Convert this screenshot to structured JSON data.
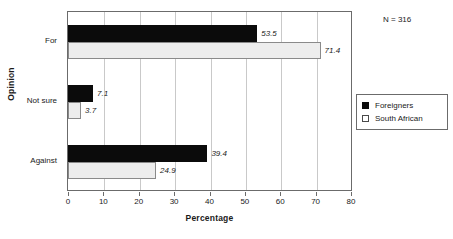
{
  "chart_data": {
    "type": "bar",
    "orientation": "horizontal",
    "title": "",
    "xlabel": "Percentage",
    "ylabel": "Opinion",
    "categories": [
      "For",
      "Not sure",
      "Against"
    ],
    "series": [
      {
        "name": "Foreigners",
        "values": [
          53.5,
          7.1,
          39.4
        ],
        "color": "#0b0b0b"
      },
      {
        "name": "South African",
        "values": [
          71.4,
          3.7,
          24.9
        ],
        "color": "#ededed"
      }
    ],
    "xlim": [
      0,
      80
    ],
    "xticks": [
      0,
      10,
      20,
      30,
      40,
      50,
      60,
      70,
      80
    ],
    "xtick_labels": [
      "0",
      "10",
      "20",
      "30",
      "40",
      "50",
      "60",
      "70",
      "80"
    ],
    "grid": "vertical",
    "data_labels": [
      "53.5",
      "71.4",
      "7.1",
      "3.7",
      "39.4",
      "24.9"
    ],
    "annotation": "N = 316",
    "legend_position": "right",
    "legend_entries": [
      "Foreigners",
      "South African"
    ]
  }
}
